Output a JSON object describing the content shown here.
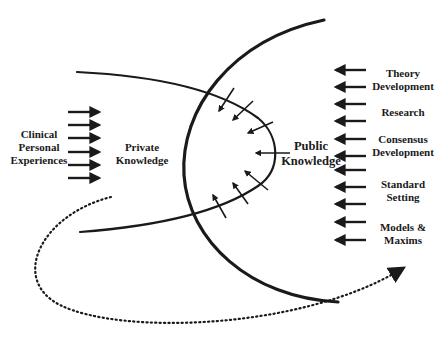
{
  "diagram": {
    "colors": {
      "ink": "#1a1a1a",
      "background": "#ffffff"
    },
    "left_source": {
      "label_lines": [
        "Clinical",
        "Personal",
        "Experiences"
      ],
      "arrow_count": 6,
      "arrow_direction": "right"
    },
    "private_knowledge": {
      "label_lines": [
        "Private",
        "Knowledge"
      ]
    },
    "public_knowledge": {
      "label_lines": [
        "Public",
        "Knowledge"
      ],
      "inward_arrow_count": 7
    },
    "right_sources": {
      "arrow_direction": "left",
      "arrow_count": 11,
      "items": [
        {
          "label_lines": [
            "Theory",
            "Development"
          ]
        },
        {
          "label_lines": [
            "Research"
          ]
        },
        {
          "label_lines": [
            "Consensus",
            "Development"
          ]
        },
        {
          "label_lines": [
            "Standard",
            "Setting"
          ]
        },
        {
          "label_lines": [
            "Models &",
            "Maxims"
          ]
        }
      ]
    },
    "cycle": {
      "style": "dotted",
      "description": "dotted curved arrow from private knowledge looping below back toward the public sources"
    }
  }
}
